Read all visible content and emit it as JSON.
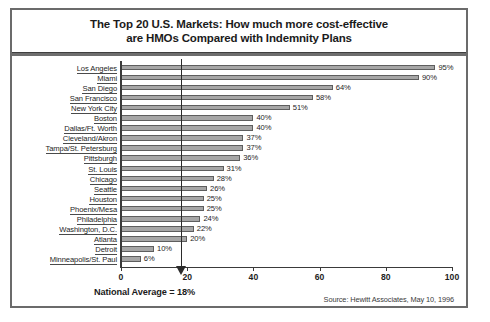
{
  "chart_data": {
    "type": "bar",
    "orientation": "horizontal",
    "title": "The Top 20 U.S. Markets: How much more cost-effective are HMOs Compared with Indemnity Plans",
    "title_lines": [
      "The Top 20 U.S. Markets: How much more cost-effective",
      "are HMOs Compared with Indemnity Plans"
    ],
    "categories": [
      "Los Angeles",
      "Miami",
      "San Diego",
      "San Francisco",
      "New York City",
      "Boston",
      "Dallas/Ft. Worth",
      "Cleveland/Akron",
      "Tampa/St. Petersburg",
      "Pittsburgh",
      "St. Louis",
      "Chicago",
      "Seattle",
      "Houston",
      "Phoenix/Mesa",
      "Philadelphia",
      "Washington, D.C.",
      "Atlanta",
      "Detroit",
      "Minneapolis/St. Paul"
    ],
    "values": [
      95,
      90,
      64,
      58,
      51,
      40,
      40,
      37,
      37,
      36,
      31,
      28,
      26,
      25,
      25,
      24,
      22,
      20,
      10,
      6
    ],
    "value_labels": [
      "95%",
      "90%",
      "64%",
      "58%",
      "51%",
      "40%",
      "40%",
      "37%",
      "37%",
      "36%",
      "31%",
      "28%",
      "26%",
      "25%",
      "25%",
      "24%",
      "22%",
      "20%",
      "10%",
      "6%"
    ],
    "xlabel": "",
    "ylabel": "",
    "xlim": [
      0,
      100
    ],
    "xticks": [
      0,
      20,
      40,
      60,
      80,
      100
    ],
    "xtick_labels": [
      "0",
      "20",
      "40",
      "60",
      "80",
      "100"
    ],
    "grid": false,
    "legend": false,
    "annotations": [
      {
        "name": "national-average",
        "text": "National Average = 18%",
        "value": 18
      }
    ],
    "source_note": "Source:  Hewitt Associates, May 10, 1996",
    "colors": {
      "bar_fill": "#a6a6a6",
      "bar_edge": "#5e5e5e",
      "axis": "#3a3a3a",
      "text": "#1d1d1d",
      "frame": "#6b6b6b"
    }
  }
}
